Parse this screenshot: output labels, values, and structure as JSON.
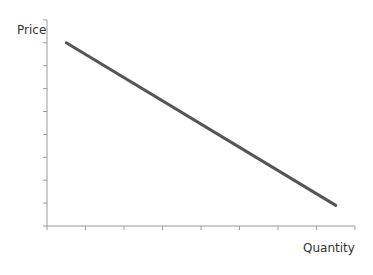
{
  "chart_data": {
    "type": "line",
    "title": "",
    "xlabel": "Quantity",
    "ylabel": "Price",
    "x_ticks": 8,
    "y_ticks": 9,
    "xlim": [
      0,
      8
    ],
    "ylim": [
      0,
      9
    ],
    "grid": false,
    "legend": null,
    "series": [
      {
        "name": "Demand",
        "color": "#555555",
        "x": [
          0.5,
          7.5
        ],
        "y": [
          8.0,
          0.9
        ]
      }
    ]
  },
  "colors": {
    "axis": "#9a9a9a",
    "line": "#555555",
    "text": "#333333"
  }
}
